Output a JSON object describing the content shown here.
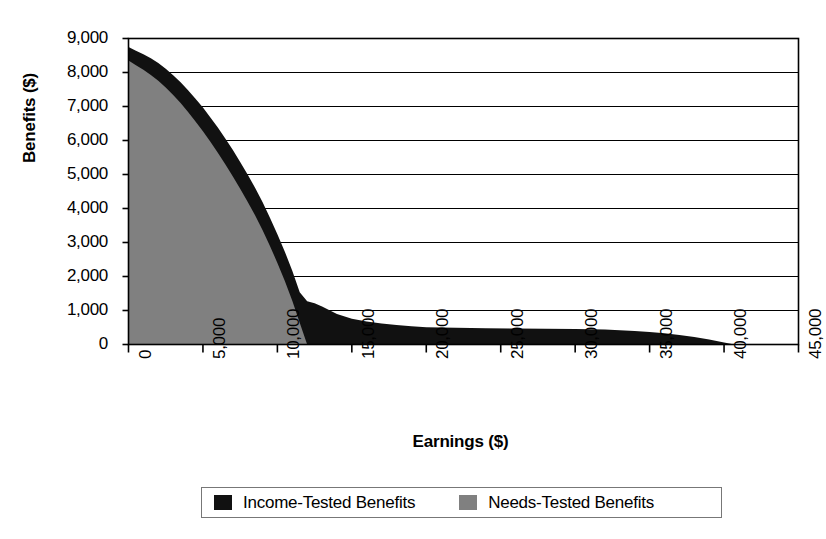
{
  "chart_data": {
    "type": "area",
    "stacked": true,
    "title": "",
    "xlabel": "Earnings ($)",
    "ylabel": "Benefits ($)",
    "xlim": [
      0,
      45000
    ],
    "ylim": [
      0,
      9000
    ],
    "xticks": [
      0,
      5000,
      10000,
      15000,
      20000,
      25000,
      30000,
      35000,
      40000,
      45000
    ],
    "xticklabels": [
      "0",
      "5,000",
      "10,000",
      "15,000",
      "20,000",
      "25,000",
      "30,000",
      "35,000",
      "40,000",
      "45,000"
    ],
    "yticks": [
      0,
      1000,
      2000,
      3000,
      4000,
      5000,
      6000,
      7000,
      8000,
      9000
    ],
    "yticklabels": [
      "0",
      "1,000",
      "2,000",
      "3,000",
      "4,000",
      "5,000",
      "6,000",
      "7,000",
      "8,000",
      "9,000"
    ],
    "grid": "horizontal",
    "legend_position": "bottom",
    "x": [
      0,
      500,
      1000,
      1500,
      2000,
      2500,
      3000,
      3500,
      4000,
      4500,
      5000,
      5500,
      6000,
      6500,
      7000,
      7500,
      8000,
      8500,
      9000,
      9500,
      10000,
      10500,
      11000,
      11500,
      12000,
      12500,
      13000,
      13500,
      14000,
      15000,
      16000,
      17000,
      18000,
      19000,
      20000,
      22000,
      24000,
      26000,
      28000,
      30000,
      32000,
      34000,
      35000,
      36000,
      37000,
      38000,
      39000,
      40000,
      40700,
      41000,
      45000
    ],
    "series": [
      {
        "name": "Needs-Tested Benefits",
        "color": "#808080",
        "values": [
          8350,
          8210,
          8080,
          7930,
          7760,
          7560,
          7340,
          7100,
          6840,
          6560,
          6270,
          5960,
          5640,
          5300,
          4950,
          4580,
          4200,
          3800,
          3370,
          2900,
          2400,
          1870,
          1290,
          640,
          0,
          0,
          0,
          0,
          0,
          0,
          0,
          0,
          0,
          0,
          0,
          0,
          0,
          0,
          0,
          0,
          0,
          0,
          0,
          0,
          0,
          0,
          0,
          0,
          0,
          0,
          0
        ]
      },
      {
        "name": "Income-Tested Benefits",
        "color": "#111111",
        "values": [
          400,
          430,
          460,
          490,
          520,
          550,
          580,
          610,
          640,
          670,
          700,
          720,
          740,
          760,
          780,
          790,
          800,
          810,
          820,
          830,
          840,
          860,
          880,
          900,
          1270,
          1210,
          1120,
          1010,
          900,
          760,
          680,
          620,
          570,
          540,
          510,
          490,
          480,
          470,
          460,
          455,
          440,
          400,
          370,
          330,
          280,
          220,
          150,
          60,
          0,
          0,
          0
        ]
      }
    ],
    "totals_note": "Values are stacked: Needs-Tested (gray, lower) + Income-Tested (black, upper)."
  },
  "legend": {
    "items": [
      {
        "label": "Income-Tested Benefits",
        "color": "#111111"
      },
      {
        "label": "Needs-Tested Benefits",
        "color": "#808080"
      }
    ]
  }
}
